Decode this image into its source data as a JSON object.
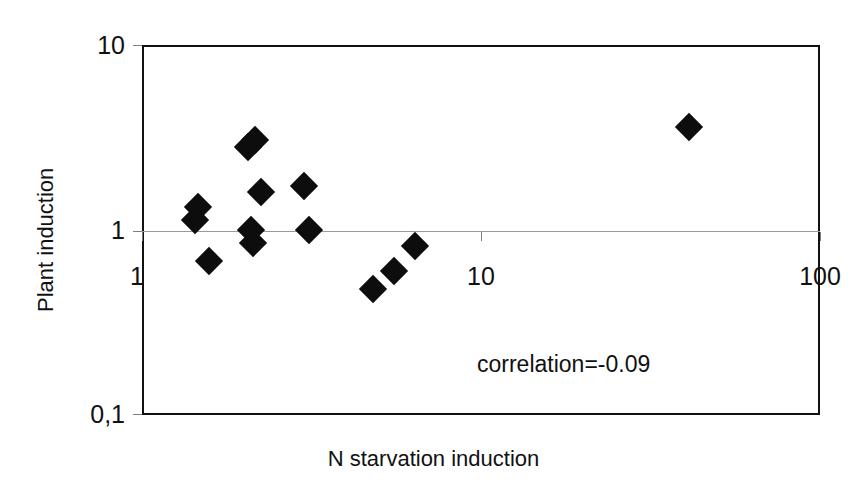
{
  "chart_data": {
    "type": "scatter",
    "title": "",
    "xlabel": "N starvation induction",
    "ylabel": "Plant induction",
    "xscale": "log",
    "yscale": "log",
    "xlim": [
      1,
      100
    ],
    "ylim": [
      0.1,
      10
    ],
    "xticks": [
      "1",
      "10",
      "100"
    ],
    "xtick_values": [
      1,
      10,
      100
    ],
    "yticks": [
      "0,1",
      "1",
      "10"
    ],
    "ytick_values": [
      0.1,
      1,
      10
    ],
    "grid": "horizontal gridline at y=1 only",
    "legend": "none",
    "marker": "filled black diamond",
    "annotations": [
      "correlation=-0.09"
    ],
    "correlation": -0.09,
    "n_points": 14,
    "points": [
      {
        "x": 2.15,
        "y": 3.05
      },
      {
        "x": 2.05,
        "y": 2.8
      },
      {
        "x": 1.46,
        "y": 1.33
      },
      {
        "x": 1.43,
        "y": 1.13
      },
      {
        "x": 2.25,
        "y": 1.6
      },
      {
        "x": 3.0,
        "y": 1.72
      },
      {
        "x": 2.1,
        "y": 1.0
      },
      {
        "x": 2.12,
        "y": 0.85
      },
      {
        "x": 3.1,
        "y": 1.0
      },
      {
        "x": 1.58,
        "y": 0.68
      },
      {
        "x": 4.8,
        "y": 0.48
      },
      {
        "x": 5.55,
        "y": 0.6
      },
      {
        "x": 6.4,
        "y": 0.82
      },
      {
        "x": 41.0,
        "y": 3.6
      }
    ]
  },
  "axes": {
    "y_ticks": [
      {
        "label": "10",
        "value": 10
      },
      {
        "label": "1",
        "value": 1
      },
      {
        "label": "0,1",
        "value": 0.1
      }
    ],
    "x_ticks": [
      {
        "label": "1",
        "value": 1
      },
      {
        "label": "10",
        "value": 10
      },
      {
        "label": "100",
        "value": 100
      }
    ],
    "y_title": "Plant induction",
    "x_title": "N starvation induction"
  },
  "annotation": {
    "correlation_text": "correlation=-0.09"
  },
  "colors": {
    "marker": "#0d0d0d",
    "frame": "#111111",
    "gridline": "#9a9a9a",
    "background": "#ffffff",
    "text": "#111111"
  }
}
